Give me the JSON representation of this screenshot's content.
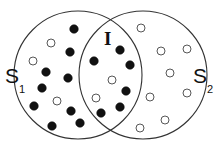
{
  "diagram": {
    "type": "venn",
    "sets": [
      {
        "id": "S1",
        "label": "S",
        "subscript": "1",
        "cx": 78,
        "cy": 75,
        "r": 64
      },
      {
        "id": "S2",
        "label": "S",
        "subscript": "2",
        "cx": 143,
        "cy": 75,
        "r": 64
      }
    ],
    "intersection_label": "I",
    "colors": {
      "stroke": "#333333",
      "filled": "#111111",
      "open_fill": "#ffffff"
    },
    "points": [
      {
        "x": 74,
        "y": 29,
        "filled": true
      },
      {
        "x": 51,
        "y": 43,
        "filled": false
      },
      {
        "x": 70,
        "y": 52,
        "filled": true
      },
      {
        "x": 33,
        "y": 61,
        "filled": false
      },
      {
        "x": 46,
        "y": 72,
        "filled": true
      },
      {
        "x": 68,
        "y": 78,
        "filled": true
      },
      {
        "x": 42,
        "y": 88,
        "filled": true
      },
      {
        "x": 57,
        "y": 101,
        "filled": false
      },
      {
        "x": 34,
        "y": 106,
        "filled": true
      },
      {
        "x": 71,
        "y": 111,
        "filled": true
      },
      {
        "x": 80,
        "y": 123,
        "filled": true
      },
      {
        "x": 52,
        "y": 126,
        "filled": true
      },
      {
        "x": 94,
        "y": 61,
        "filled": true
      },
      {
        "x": 120,
        "y": 50,
        "filled": true
      },
      {
        "x": 130,
        "y": 65,
        "filled": true
      },
      {
        "x": 112,
        "y": 80,
        "filled": false
      },
      {
        "x": 126,
        "y": 91,
        "filled": true
      },
      {
        "x": 96,
        "y": 98,
        "filled": false
      },
      {
        "x": 120,
        "y": 107,
        "filled": true
      },
      {
        "x": 101,
        "y": 113,
        "filled": true
      },
      {
        "x": 141,
        "y": 28,
        "filled": false
      },
      {
        "x": 161,
        "y": 51,
        "filled": false
      },
      {
        "x": 187,
        "y": 49,
        "filled": false
      },
      {
        "x": 170,
        "y": 73,
        "filled": false
      },
      {
        "x": 150,
        "y": 97,
        "filled": false
      },
      {
        "x": 187,
        "y": 93,
        "filled": false
      },
      {
        "x": 165,
        "y": 120,
        "filled": false
      },
      {
        "x": 140,
        "y": 128,
        "filled": false
      }
    ]
  }
}
